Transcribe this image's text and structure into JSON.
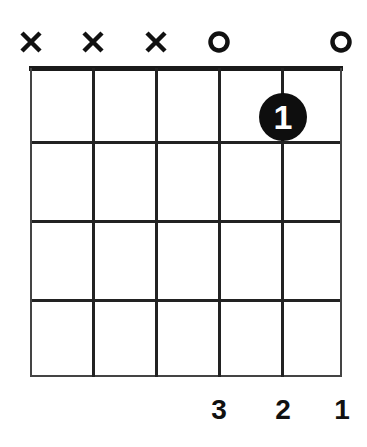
{
  "chord_diagram": {
    "strings": 6,
    "frets_shown": 4,
    "string_markers": [
      "x",
      "x",
      "x",
      "o",
      "",
      "o"
    ],
    "fingered_notes": [
      {
        "string": 5,
        "fret": 1,
        "finger": "1"
      }
    ],
    "bottom_labels": [
      "",
      "",
      "",
      "3",
      "2",
      "1"
    ]
  }
}
